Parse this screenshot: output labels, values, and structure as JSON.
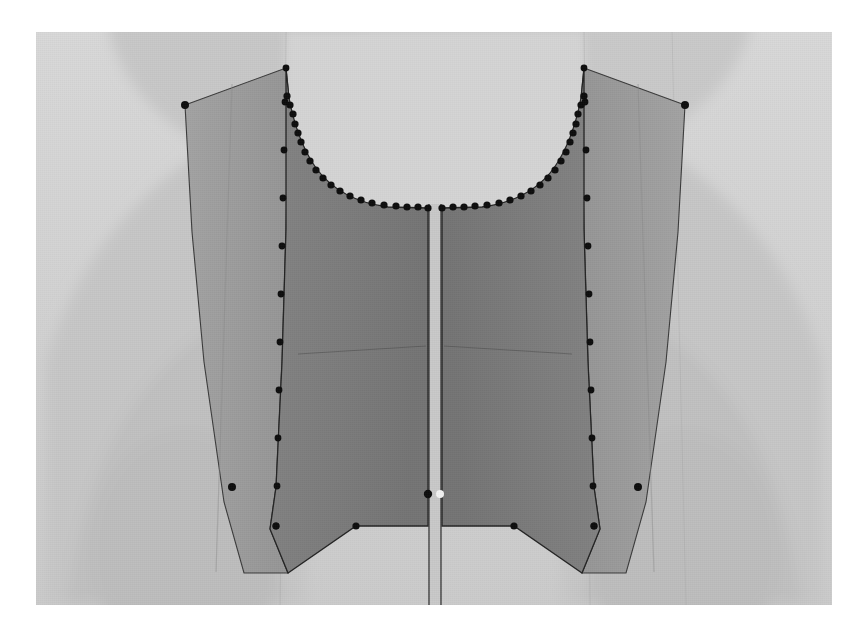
{
  "app": {
    "title": "3D Garment Simulation Viewport",
    "view_label": "Front View"
  },
  "canvas": {
    "x": 36,
    "y": 32,
    "width": 796,
    "height": 573,
    "background_color": "#d3d3d3",
    "page_background_color": "#ffffff"
  },
  "colors": {
    "viewport_background": "#d3d3d3",
    "avatar_body_light": "#cfcfcf",
    "avatar_body_shadow": "#bcbcbc",
    "avatar_body_shadow_deep": "#b3b3b3",
    "panel_outer_fill": "#9d9d9d",
    "panel_inner_fill": "#7d7d7d",
    "panel_inner_fill_dark": "#767676",
    "outline_stroke": "#2a2a2a",
    "seam_line": "#5d5d5d",
    "control_point_fill": "#0d0d0d",
    "control_point_selected_fill": "#f2f2f2",
    "center_gap_fill": "#c9c9c9"
  },
  "scene": {
    "object_name": "bodice-front",
    "pieces": [
      {
        "name": "left-front-outer-panel",
        "side": "left",
        "layer": "outer"
      },
      {
        "name": "left-front-inner-panel",
        "side": "left",
        "layer": "inner"
      },
      {
        "name": "right-front-inner-panel",
        "side": "right",
        "layer": "inner"
      },
      {
        "name": "right-front-outer-panel",
        "side": "right",
        "layer": "outer"
      }
    ],
    "center_front_seam": "center-front-opening",
    "bust_seam_label": "bust-seam-line"
  },
  "geometry": {
    "left_outer_panel_path": "M 149 73 L 250 36 L 253 64 L 250 197 L 246 330 L 240 452 L 234 497 L 245 541 L 208 541 L 188 470 L 170 330 L 158 200 Z",
    "left_inner_panel_path": "M 250 36 L 253 64 C 262 86 272 110 288 130 C 306 152 330 168 360 174 L 392 174 L 392 157 L 390 300 L 388 420 L 388 494 L 320 494 L 252 540 L 245 541 L 234 497 L 240 452 L 246 330 L 250 197 Z",
    "right_inner_panel_path": "M 548 36 L 545 64 C 536 86 526 110 510 130 C 492 152 468 168 438 174 L 406 174 L 406 157 L 408 300 L 410 420 L 410 494 L 478 494 L 546 540 L 553 541 L 564 497 L 558 452 L 552 330 L 548 197 Z",
    "right_outer_panel_path": "M 649 73 L 548 36 L 545 64 L 548 197 L 552 330 L 558 452 L 564 497 L 553 541 L 590 541 L 610 470 L 628 330 L 640 200 Z",
    "center_gap_rect": {
      "x": 394,
      "y": 170,
      "width": 10,
      "height": 403
    },
    "bust_seam_left": "M 258 318 L 388 312",
    "bust_seam_right": "M 540 318 L 410 312",
    "fold_line_left": "M 250 40 L 244 540",
    "fold_line_right": "M 548 40 L 554 540",
    "outer_fold_left": "M 196 50 L 182 540",
    "outer_fold_right": "M 602 50 L 616 540"
  },
  "avatar_silhouette": {
    "head_shadow_path": "M 96 0 C 96 -70 190 -130 300 -130 C 380 -130 430 -90 440 -20 L 440 140 L 96 140 Z",
    "left_shoulder_path": "M 20 300 C 60 190 140 120 250 90 L 250 573 L 20 573 Z",
    "right_shoulder_path": "M 776 300 C 736 190 656 120 546 90 L 546 573 L 776 573 Z",
    "left_arm_path": "M 40 573 C 60 440 110 360 180 320 L 236 573 Z",
    "right_arm_path": "M 756 573 C 736 440 686 360 616 320 L 560 573 Z",
    "torso_mid_path": "M 250 0 L 546 0 L 546 573 L 250 573 Z"
  },
  "control_points": {
    "label": "pattern-control-points",
    "count_total": 78,
    "left_neckline": [
      [
        251,
        64
      ],
      [
        254,
        73
      ],
      [
        257,
        82
      ],
      [
        259,
        92
      ],
      [
        262,
        101
      ],
      [
        265,
        110
      ],
      [
        269,
        120
      ],
      [
        274,
        129
      ],
      [
        280,
        138
      ],
      [
        287,
        146
      ],
      [
        295,
        153
      ],
      [
        304,
        159
      ],
      [
        314,
        164
      ],
      [
        325,
        168
      ],
      [
        336,
        171
      ],
      [
        348,
        173
      ],
      [
        360,
        174
      ],
      [
        371,
        175
      ],
      [
        382,
        175
      ],
      [
        392,
        176
      ]
    ],
    "right_neckline": [
      [
        548,
        64
      ],
      [
        545,
        73
      ],
      [
        542,
        82
      ],
      [
        540,
        92
      ],
      [
        537,
        101
      ],
      [
        534,
        110
      ],
      [
        530,
        120
      ],
      [
        525,
        129
      ],
      [
        519,
        138
      ],
      [
        512,
        146
      ],
      [
        504,
        153
      ],
      [
        495,
        159
      ],
      [
        485,
        164
      ],
      [
        474,
        168
      ],
      [
        463,
        171
      ],
      [
        451,
        173
      ],
      [
        439,
        174
      ],
      [
        428,
        175
      ],
      [
        417,
        175
      ],
      [
        406,
        176
      ]
    ],
    "left_fold_edge": [
      [
        250,
        36
      ],
      [
        249,
        70
      ],
      [
        248,
        118
      ],
      [
        247,
        166
      ],
      [
        246,
        214
      ],
      [
        245,
        262
      ],
      [
        244,
        310
      ],
      [
        243,
        358
      ],
      [
        242,
        406
      ],
      [
        241,
        454
      ],
      [
        240,
        494
      ]
    ],
    "right_fold_edge": [
      [
        548,
        36
      ],
      [
        549,
        70
      ],
      [
        550,
        118
      ],
      [
        551,
        166
      ],
      [
        552,
        214
      ],
      [
        553,
        262
      ],
      [
        554,
        310
      ],
      [
        555,
        358
      ],
      [
        556,
        406
      ],
      [
        557,
        454
      ],
      [
        558,
        494
      ]
    ],
    "left_outer_edge": [
      [
        149,
        73
      ],
      [
        196,
        455
      ]
    ],
    "right_outer_edge": [
      [
        649,
        73
      ],
      [
        602,
        455
      ]
    ],
    "left_hem": [
      [
        240,
        494
      ],
      [
        320,
        494
      ]
    ],
    "right_hem": [
      [
        558,
        494
      ],
      [
        478,
        494
      ]
    ]
  },
  "selected_point": {
    "name": "selected-vertex",
    "x": 404,
    "y": 462,
    "state": "selected",
    "color": "#f2f2f2"
  },
  "active_point": {
    "name": "active-vertex",
    "x": 392,
    "y": 462,
    "state": "active",
    "color": "#0d0d0d"
  }
}
